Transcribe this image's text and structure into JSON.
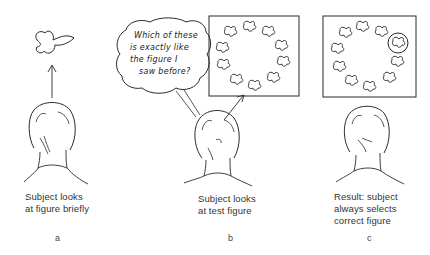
{
  "panels": [
    {
      "id": "a",
      "label": "a",
      "caption_lines": [
        "Subject looks",
        "at figure briefly"
      ]
    },
    {
      "id": "b",
      "label": "b",
      "caption_lines": [
        "Subject looks",
        "at test figure"
      ],
      "thought_bubble_lines": [
        "Which of these",
        "is exactly like",
        "the figure I",
        "saw before?"
      ]
    },
    {
      "id": "c",
      "label": "c",
      "caption_lines": [
        "Result: subject",
        "always selects",
        "correct figure"
      ]
    }
  ],
  "colors": {
    "ink": "#2a2a2a",
    "background": "#ffffff"
  }
}
